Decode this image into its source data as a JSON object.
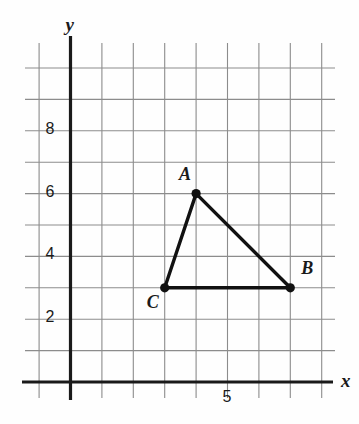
{
  "figure": {
    "axes": {
      "x_label": "x",
      "y_label": "y",
      "x_ticks": [
        {
          "value": "5",
          "at": 5
        }
      ],
      "y_ticks": [
        {
          "value": "2",
          "at": 2
        },
        {
          "value": "4",
          "at": 4
        },
        {
          "value": "6",
          "at": 6
        },
        {
          "value": "8",
          "at": 8
        }
      ],
      "x_range": [
        -1,
        8.5
      ],
      "y_range": [
        -0.6,
        10.5
      ],
      "grid": true
    },
    "colors": {
      "grid": "#8c8c8c",
      "axis": "#1a1a1a",
      "shape": "#111111",
      "background": "#ffffff"
    },
    "points": [
      {
        "name": "A",
        "x": 4,
        "y": 6,
        "label_dx": -17,
        "label_dy": -30
      },
      {
        "name": "B",
        "x": 7,
        "y": 3,
        "label_dx": 11,
        "label_dy": -30
      },
      {
        "name": "C",
        "x": 3,
        "y": 3,
        "label_dx": -18,
        "label_dy": 4
      }
    ],
    "segments": [
      {
        "from": "A",
        "to": "B"
      },
      {
        "from": "B",
        "to": "C"
      },
      {
        "from": "C",
        "to": "A"
      }
    ]
  },
  "chart_data": {
    "type": "scatter",
    "xlabel": "x",
    "ylabel": "y",
    "xlim": [
      -1,
      8.5
    ],
    "ylim": [
      -0.6,
      10.5
    ],
    "grid": true,
    "legend": "none",
    "x_tick_labels": [
      "5"
    ],
    "y_tick_labels": [
      "2",
      "4",
      "6",
      "8"
    ],
    "series": [
      {
        "name": "Triangle ABC vertices",
        "labels": [
          "A",
          "B",
          "C"
        ],
        "x": [
          4,
          7,
          3
        ],
        "y": [
          6,
          3,
          3
        ]
      }
    ],
    "annotations": [
      {
        "text": "A",
        "x": 4,
        "y": 6
      },
      {
        "text": "B",
        "x": 7,
        "y": 3
      },
      {
        "text": "C",
        "x": 3,
        "y": 3
      }
    ]
  }
}
